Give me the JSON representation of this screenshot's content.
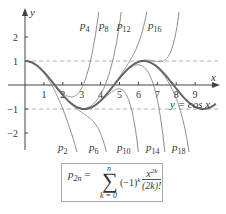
{
  "chart_data": {
    "type": "line",
    "title": "",
    "xlabel": "x",
    "ylabel": "y",
    "xlim": [
      -1,
      10
    ],
    "ylim": [
      -3,
      3
    ],
    "x_ticks": [
      "1",
      "2",
      "3",
      "4",
      "5",
      "6",
      "7",
      "8",
      "9"
    ],
    "y_ticks": [
      "2",
      "1",
      "-1",
      "-2"
    ],
    "grid": false,
    "reference_lines": [
      {
        "y": 1,
        "style": "dashed"
      },
      {
        "y": -1,
        "style": "dashed"
      }
    ],
    "series": [
      {
        "name": "y = cos x",
        "function": "cos(x)"
      },
      {
        "name": "p2",
        "n": 1
      },
      {
        "name": "p4",
        "n": 2
      },
      {
        "name": "p6",
        "n": 3
      },
      {
        "name": "p8",
        "n": 4
      },
      {
        "name": "p10",
        "n": 5
      },
      {
        "name": "p12",
        "n": 6
      },
      {
        "name": "p14",
        "n": 7
      },
      {
        "name": "p16",
        "n": 8
      },
      {
        "name": "p18",
        "n": 9
      }
    ],
    "annotations": [
      "y = cos x",
      "p_2n = Σ_{k=0}^{n} (-1)^k x^{2k}/(2k)!"
    ]
  },
  "labels": {
    "y_axis": "y",
    "x_axis": "x",
    "cos_label": "y = cos x",
    "top": [
      {
        "t": "p",
        "s": "4"
      },
      {
        "t": "p",
        "s": "8"
      },
      {
        "t": "p",
        "s": "12"
      },
      {
        "t": "p",
        "s": "16"
      }
    ],
    "bottom": [
      {
        "t": "p",
        "s": "2"
      },
      {
        "t": "p",
        "s": "6"
      },
      {
        "t": "p",
        "s": "10"
      },
      {
        "t": "p",
        "s": "14"
      },
      {
        "t": "p",
        "s": "18"
      }
    ]
  },
  "formula": {
    "lhs": "p",
    "lhs_sub": "2n",
    "eq": "=",
    "sum": "∑",
    "upper": "n",
    "lower": "k = 0",
    "term": "(−1)",
    "term_sup": "k",
    "num": "x",
    "num_sup": "2k",
    "den": "(2k)!"
  }
}
